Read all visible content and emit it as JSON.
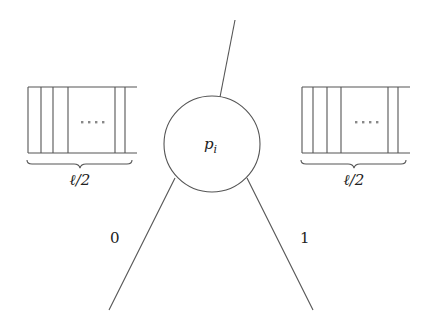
{
  "diagram": {
    "node": {
      "label": "p",
      "subscript": "i",
      "cx": 212,
      "cy": 144,
      "r": 48
    },
    "parent_edge": {
      "x1": 235,
      "y1": 20,
      "x2": 220,
      "y2": 97
    },
    "edges": [
      {
        "label": "0",
        "x1": 175,
        "y1": 178,
        "x2": 109,
        "y2": 310,
        "label_x": 115,
        "label_y": 240
      },
      {
        "label": "1",
        "x1": 247,
        "y1": 178,
        "x2": 313,
        "y2": 310,
        "label_x": 302,
        "label_y": 240
      }
    ],
    "arrays": [
      {
        "side": "left",
        "brace_label": "ℓ/2",
        "dots": "····"
      },
      {
        "side": "right",
        "brace_label": "ℓ/2",
        "dots": "····"
      }
    ],
    "colors": {
      "line": "#555555",
      "text": "#222222"
    }
  }
}
